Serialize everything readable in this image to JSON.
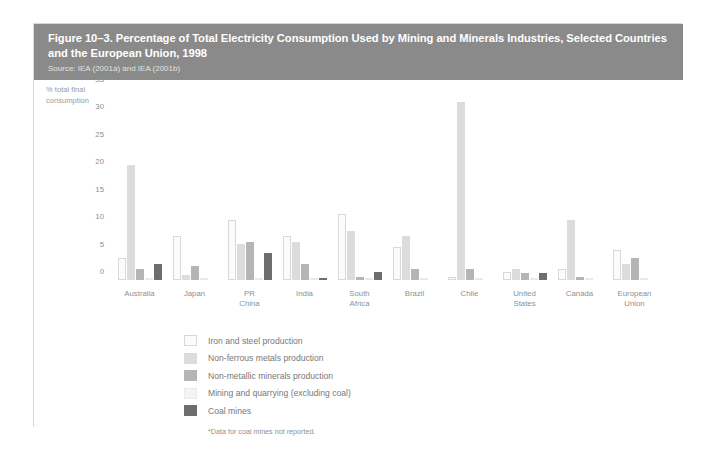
{
  "figure": {
    "title": "Figure 10–3. Percentage of Total Electricity Consumption Used by Mining and Minerals Industries, Selected Countries and the European Union, 1998",
    "source": "Source: IEA (2001a) and IEA (2001b)",
    "footnote": "*Data for coal mines not reported.",
    "header_bg": "#8a8a8a",
    "header_text_color": "#ffffff"
  },
  "chart_data": {
    "type": "bar",
    "title": "Figure 10–3. Percentage of Total Electricity Consumption Used by Mining and Minerals Industries, Selected Countries and the European Union, 1998",
    "xlabel": "",
    "ylabel": "% total final consumption",
    "ylim": [
      0,
      35
    ],
    "yticks": [
      0,
      5,
      10,
      15,
      20,
      25,
      30,
      35
    ],
    "grid": false,
    "legend_position": "below-left",
    "categories": [
      "Australia",
      "Japan",
      "PR China",
      "India",
      "South Africa",
      "Brazil",
      "Chile",
      "United States",
      "Canada",
      "European\nUnion"
    ],
    "series": [
      {
        "name": "Iron and steel production",
        "color": "#fbfbfb",
        "values": [
          4.0,
          8.0,
          11.0,
          8.0,
          12.0,
          6.0,
          0.5,
          1.5,
          2.0,
          5.5
        ]
      },
      {
        "name": "Non-ferrous metals production",
        "color": "#dcdcdc",
        "values": [
          21.0,
          1.0,
          6.5,
          7.0,
          9.0,
          8.0,
          32.5,
          2.0,
          11.0,
          3.0
        ]
      },
      {
        "name": "Non-metallic minerals production",
        "color": "#b5b5b5",
        "values": [
          2.0,
          2.5,
          7.0,
          3.0,
          0.5,
          2.0,
          2.0,
          1.3,
          0.5,
          4.0
        ]
      },
      {
        "name": "Mining and quarrying (excluding coal)",
        "color": "#f4f4f4",
        "values": [
          0.3,
          0.3,
          0.3,
          0.3,
          0.2,
          0.3,
          0.3,
          0.2,
          0.4,
          0.3
        ]
      },
      {
        "name": "Coal mines",
        "color": "#6e6e6e",
        "values": [
          3.0,
          0.0,
          5.0,
          0.3,
          1.5,
          0.0,
          0.0,
          1.2,
          0.0,
          0.0
        ]
      }
    ]
  },
  "legend": {
    "items": [
      {
        "label": "Iron and steel production",
        "swatch_class": "s0"
      },
      {
        "label": "Non-ferrous metals production",
        "swatch_class": "s1"
      },
      {
        "label": "Non-metallic minerals production",
        "swatch_class": "s2"
      },
      {
        "label": "Mining and quarrying (excluding coal)",
        "swatch_class": "s3"
      },
      {
        "label": "Coal mines",
        "swatch_class": "s4"
      }
    ]
  }
}
